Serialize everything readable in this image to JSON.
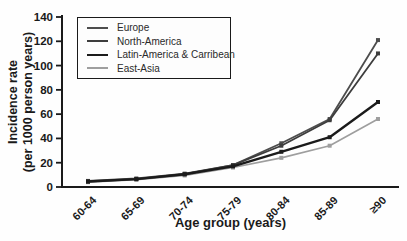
{
  "chart_data": {
    "type": "line",
    "title": "",
    "xlabel": "Age group  (years)",
    "ylabel_line1": "Incidence rate",
    "ylabel_line2": "(per 1000 person years)",
    "categories": [
      "60-64",
      "65-69",
      "70-74",
      "75-79",
      "80-84",
      "85-89",
      "≥90"
    ],
    "yticks": [
      0,
      20,
      40,
      60,
      80,
      100,
      120,
      140
    ],
    "ylim": [
      0,
      140
    ],
    "grid": false,
    "legend_position": "top-left",
    "axis_color": "#1a1a1a",
    "series": [
      {
        "name": "Europe",
        "color": "#4d4d4d",
        "line_width": 1.8,
        "values": [
          5,
          7,
          11,
          18,
          36,
          56,
          121
        ]
      },
      {
        "name": "North-America",
        "color": "#3d3d3d",
        "line_width": 1.8,
        "values": [
          4.5,
          6.5,
          10.5,
          18,
          34,
          55,
          110
        ]
      },
      {
        "name": "Latin-America & Carribean",
        "color": "#1b1b1b",
        "line_width": 2.4,
        "values": [
          4.5,
          6.5,
          10.5,
          17,
          29,
          41,
          70
        ]
      },
      {
        "name": "East-Asia",
        "color": "#9e9e9e",
        "line_width": 1.6,
        "values": [
          4,
          6,
          9.5,
          16,
          24,
          34,
          56
        ]
      }
    ]
  }
}
